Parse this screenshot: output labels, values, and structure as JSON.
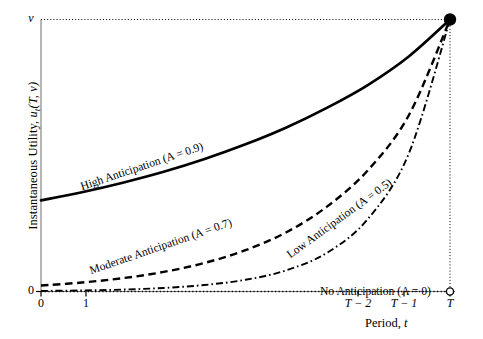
{
  "chart_data": {
    "type": "line",
    "title": "",
    "xlabel": "Period, t",
    "ylabel": "Instantaneous Utility, u_t(T, v)",
    "grid": false,
    "legend_position": "inline-curve-labels",
    "xlim": [
      0,
      1
    ],
    "ylim": [
      0,
      1
    ],
    "x_tick_labels": [
      "0",
      "1",
      "T − 2",
      "T − 1",
      "T"
    ],
    "x_tick_positions": [
      0.0,
      0.11,
      0.775,
      0.888,
      1.0
    ],
    "y_tick_labels": [
      "0",
      "v"
    ],
    "y_tick_positions": [
      0.0,
      1.0
    ],
    "annotations": [
      "Terminal point: all curves converge to v at t = T (filled marker)",
      "Open marker at (T, 0) on the horizontal axis",
      "Horizontal dotted reference line at u = v",
      "Vertical dotted reference line at t = T"
    ],
    "series": [
      {
        "name": "High Anticipation (A = 0.9)",
        "A": 0.9,
        "style": "solid",
        "label": "High Anticipation (A = 0.9)",
        "x": [
          0.0,
          0.1,
          0.2,
          0.3,
          0.4,
          0.5,
          0.6,
          0.7,
          0.8,
          0.9,
          1.0
        ],
        "y": [
          0.335,
          0.365,
          0.4,
          0.44,
          0.487,
          0.541,
          0.603,
          0.676,
          0.76,
          0.865,
          1.0
        ]
      },
      {
        "name": "Moderate Anticipation (A = 0.7)",
        "A": 0.7,
        "style": "dashed",
        "label": "Moderate Anticipation (A = 0.7)",
        "x": [
          0.0,
          0.1,
          0.2,
          0.3,
          0.4,
          0.5,
          0.6,
          0.7,
          0.8,
          0.9,
          1.0
        ],
        "y": [
          0.022,
          0.033,
          0.049,
          0.072,
          0.105,
          0.152,
          0.218,
          0.313,
          0.447,
          0.65,
          1.0
        ]
      },
      {
        "name": "Low Anticipation (A = 0.5)",
        "A": 0.5,
        "style": "dash-dot",
        "label": "Low Anticipation (A = 0.5)",
        "x": [
          0.0,
          0.1,
          0.2,
          0.3,
          0.4,
          0.5,
          0.6,
          0.7,
          0.8,
          0.9,
          1.0
        ],
        "y": [
          0.002,
          0.004,
          0.007,
          0.013,
          0.024,
          0.043,
          0.078,
          0.143,
          0.268,
          0.51,
          1.0
        ]
      },
      {
        "name": "No Anticipation (A = 0)",
        "A": 0,
        "style": "dotted",
        "label": "No Anticipation (A = 0)",
        "x": [
          0.0,
          0.25,
          0.5,
          0.75,
          0.99,
          1.0
        ],
        "y": [
          0.0,
          0.0,
          0.0,
          0.0,
          0.0,
          1.0
        ]
      }
    ]
  },
  "axes": {
    "y_title_prefix": "Instantaneous Utility, ",
    "y_title_symbol": "u",
    "y_title_sub": "t",
    "y_title_args": "(T, v)",
    "x_title_prefix": "Period, ",
    "x_title_symbol": "t"
  },
  "ticks": {
    "y_top": "v",
    "y_bottom": "0",
    "x0": "0",
    "x1": "1",
    "x_tminus2": "T − 2",
    "x_tminus1": "T − 1",
    "x_t": "T"
  },
  "curve_labels": {
    "high": "High Anticipation (A = 0.9)",
    "moderate": "Moderate Anticipation (A = 0.7)",
    "low": "Low Anticipation (A = 0.5)",
    "none": "No Anticipation (A = 0)"
  },
  "colors": {
    "ink": "#000000",
    "background": "#ffffff",
    "frame": "#808080"
  }
}
